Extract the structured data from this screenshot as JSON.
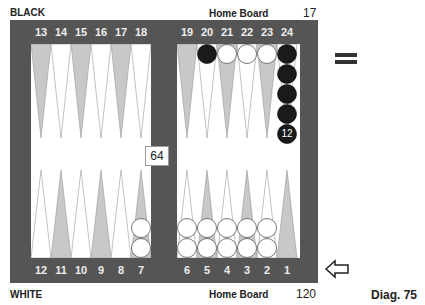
{
  "top_label": "BLACK",
  "bottom_label": "WHITE",
  "top_home_label": "Home Board",
  "bottom_home_label": "Home Board",
  "top_pip": "17",
  "bottom_pip": "120",
  "cube_value": "64",
  "diagram_label": "Diag. 75",
  "top_left_points": [
    "13",
    "14",
    "15",
    "16",
    "17",
    "18"
  ],
  "top_right_points": [
    "19",
    "20",
    "21",
    "22",
    "23",
    "24"
  ],
  "bottom_left_points": [
    "12",
    "11",
    "10",
    "9",
    "8",
    "7"
  ],
  "bottom_right_points": [
    "6",
    "5",
    "4",
    "3",
    "2",
    "1"
  ],
  "stack_label_24": "12",
  "colors": {
    "board": "#555555",
    "dark_point": "#c8c8c8",
    "light_point": "#ffffff",
    "black_checker": "#1a1a1a",
    "white_checker": "#ffffff"
  },
  "position": {
    "black": {
      "20": 1,
      "24": 12
    },
    "white": {
      "21": 1,
      "22": 1,
      "23": 1,
      "7": 2,
      "6": 2,
      "5": 2,
      "4": 2,
      "3": 2,
      "2": 2
    }
  }
}
